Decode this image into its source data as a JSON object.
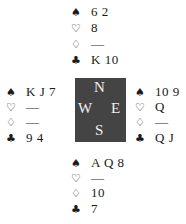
{
  "suits": {
    "spades": "♠",
    "hearts": "♡",
    "diamonds": "♢",
    "clubs": "♣"
  },
  "hands": {
    "north": {
      "spades": "6 2",
      "hearts": "8",
      "diamonds": "—",
      "clubs": "K 10"
    },
    "west": {
      "spades": "K J 7",
      "hearts": "—",
      "diamonds": "—",
      "clubs": "9 4"
    },
    "east": {
      "spades": "10 9",
      "hearts": "Q",
      "diamonds": "—",
      "clubs": "Q J"
    },
    "south": {
      "spades": "A Q 8",
      "hearts": "—",
      "diamonds": "10",
      "clubs": "7"
    }
  },
  "compass": {
    "north": "N",
    "south": "S",
    "east": "E",
    "west": "W",
    "color": "#444444"
  }
}
